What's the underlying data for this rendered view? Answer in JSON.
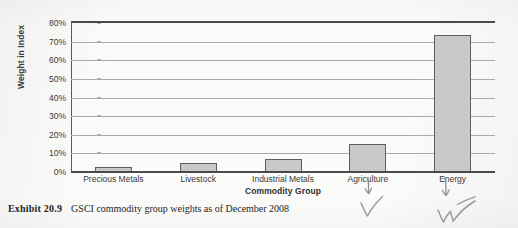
{
  "figure": {
    "caption_label": "Exhibit  20.9",
    "caption_text": "GSCI commodity group weights as of December 2008"
  },
  "annotations": [
    {
      "name": "arrow-check-agriculture",
      "target": "Agriculture",
      "kind": "handwritten-arrow-and-checkmark"
    },
    {
      "name": "arrow-check-energy",
      "target": "Energy",
      "kind": "handwritten-arrow-and-checkmark"
    }
  ],
  "chart_data": {
    "type": "bar",
    "title": "",
    "xlabel": "Commodity Group",
    "ylabel": "Weight in Index",
    "categories": [
      "Precious Metals",
      "Livestock",
      "Industrial Metals",
      "Agriculture",
      "Energy"
    ],
    "values": [
      2.5,
      5.0,
      7.0,
      15.0,
      73.5
    ],
    "value_suffix": "%",
    "ylim": [
      0,
      80
    ],
    "ytick_step": 10,
    "ytick_labels": [
      "0%",
      "10%",
      "20%",
      "30%",
      "40%",
      "50%",
      "60%",
      "70%",
      "80%"
    ],
    "ytick_values": [
      0,
      10,
      20,
      30,
      40,
      50,
      60,
      70,
      80
    ],
    "grid": true,
    "grid_axis": "y",
    "legend": false,
    "legend_position": "none",
    "bar_fill_color": "#c9c9c9",
    "bar_border_color": "#5e5e5e",
    "gridline_color": "#a9a9a9",
    "axis_color": "#4a4a4a",
    "text_color": "#3a3a3a",
    "background_color": "#fbfbfa"
  }
}
